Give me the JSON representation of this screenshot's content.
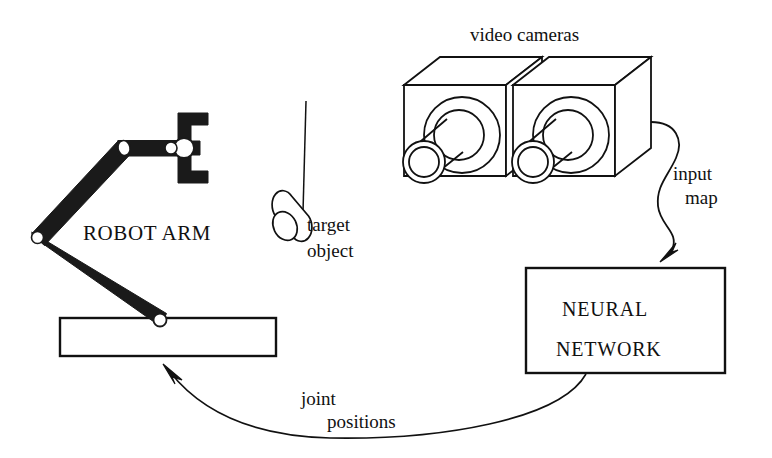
{
  "figure": {
    "background_color": "#ffffff",
    "ink_color": "#111111"
  },
  "labels": {
    "video_cameras": "video cameras",
    "robot_arm": "ROBOT ARM",
    "target_line1": "target",
    "target_line2": "object",
    "input_map_line1": "input",
    "input_map_line2": "map",
    "neural_network_line1": "NEURAL",
    "neural_network_line2": "NETWORK",
    "joint_positions_line1": "joint",
    "joint_positions_line2": "positions"
  },
  "components": {
    "robot": {
      "name": "robot-arm",
      "base_platform": {
        "x": 60,
        "y": 318,
        "width": 215,
        "height": 38,
        "fill": "#ffffff",
        "stroke": "#111111"
      },
      "shoulder_joint": {
        "cx": 38,
        "cy": 238,
        "r": 6
      },
      "elbow_joint": {
        "cx": 124,
        "cy": 148,
        "r": 6
      },
      "wrist_joint": {
        "cx": 185,
        "cy": 148,
        "r": 9
      },
      "base_joint": {
        "cx": 160,
        "cy": 320,
        "r": 6
      },
      "link_color": "#1a1a1a",
      "gripper": {
        "x": 180,
        "y": 115,
        "width": 28,
        "height": 66
      }
    },
    "cameras": {
      "name": "video-cameras",
      "count": 2,
      "fill": "#ffffff",
      "stroke": "#111111"
    },
    "target_object": {
      "name": "target-object",
      "shape": "cylinder",
      "string_top": {
        "x": 306,
        "y": 103
      },
      "string_bottom": {
        "x": 306,
        "y": 208
      }
    },
    "neural_network_box": {
      "name": "neural-network-box",
      "x": 525,
      "y": 268,
      "width": 200,
      "height": 105,
      "fill": "#ffffff",
      "stroke": "#111111"
    },
    "arrows": {
      "input_map": {
        "from": "cameras",
        "to": "neural-network-box",
        "style": "s-curve"
      },
      "joint_positions": {
        "from": "neural-network-box",
        "to": "robot-base",
        "style": "wide-arc"
      }
    }
  }
}
